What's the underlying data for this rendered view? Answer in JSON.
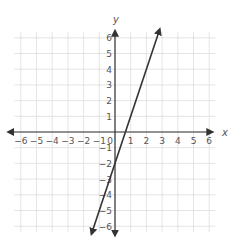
{
  "chart_data": {
    "type": "line",
    "title": "",
    "xlabel": "x",
    "ylabel": "y",
    "xlim": [
      -6,
      6
    ],
    "ylim": [
      -6,
      6
    ],
    "grid": true,
    "x_ticks": [
      -6,
      -5,
      -4,
      -3,
      -2,
      -1,
      0,
      1,
      2,
      3,
      4,
      5,
      6
    ],
    "y_ticks": [
      -6,
      -5,
      -4,
      -3,
      -2,
      -1,
      1,
      2,
      3,
      4,
      5,
      6
    ],
    "series": [
      {
        "name": "line",
        "equation": "y = 3x - 2",
        "slope": 3,
        "intercept": -2,
        "x": [
          -1.5,
          2.85
        ],
        "y": [
          -6.5,
          6.55
        ],
        "color": "#333333",
        "arrows": "both"
      }
    ]
  },
  "colors": {
    "grid": "#dddddd",
    "axis": "#333333",
    "text": "#555555"
  }
}
